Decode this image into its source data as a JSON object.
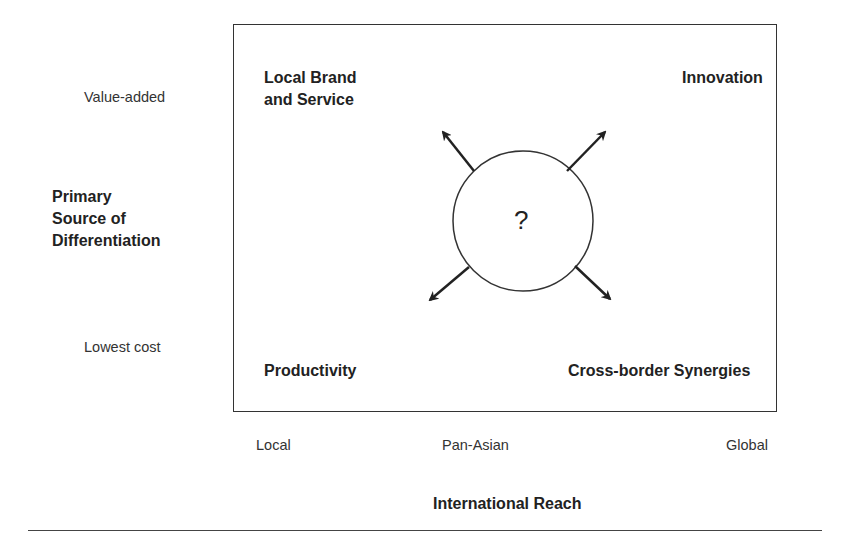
{
  "diagram": {
    "quadrants": {
      "top_left": [
        "Local Brand",
        "and Service"
      ],
      "top_right": "Innovation",
      "bottom_left": "Productivity",
      "bottom_right": "Cross-border Synergies"
    },
    "center_label": "?",
    "y_axis": {
      "title": [
        "Primary",
        "Source of",
        "Differentiation"
      ],
      "ticks": {
        "top": "Value-added",
        "bottom": "Lowest cost"
      }
    },
    "x_axis": {
      "title": "International Reach",
      "ticks": [
        "Local",
        "Pan-Asian",
        "Global"
      ]
    },
    "colors": {
      "stroke": "#333333",
      "text": "#222222"
    }
  }
}
